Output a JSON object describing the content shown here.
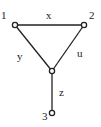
{
  "diagram": {
    "type": "graph",
    "nodes": [
      {
        "id": "1",
        "label": "1",
        "x": 15,
        "y": 25
      },
      {
        "id": "2",
        "label": "2",
        "x": 84,
        "y": 25
      },
      {
        "id": "c",
        "label": "",
        "x": 52,
        "y": 71
      },
      {
        "id": "3",
        "label": "3",
        "x": 52,
        "y": 113
      }
    ],
    "edges": [
      {
        "from": "1",
        "to": "2",
        "label": "x"
      },
      {
        "from": "1",
        "to": "c",
        "label": "y"
      },
      {
        "from": "2",
        "to": "c",
        "label": "u"
      },
      {
        "from": "c",
        "to": "3",
        "label": "z"
      }
    ]
  },
  "labels": {
    "node1": "1",
    "node2": "2",
    "node3": "3",
    "edge_x": "x",
    "edge_y": "y",
    "edge_u": "u",
    "edge_z": "z"
  },
  "colors": {
    "stroke": "#222222",
    "background": "#ffffff"
  }
}
